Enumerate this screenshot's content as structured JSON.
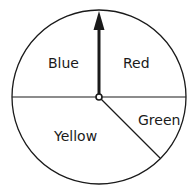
{
  "spinner": {
    "sections": [
      {
        "label": "Blue",
        "start_deg": 90,
        "end_deg": 180,
        "fraction": 0.25
      },
      {
        "label": "Red",
        "start_deg": 0,
        "end_deg": 90,
        "fraction": 0.25
      },
      {
        "label": "Green",
        "start_deg": -45,
        "end_deg": 0,
        "fraction": 0.125
      },
      {
        "label": "Yellow",
        "start_deg": 180,
        "end_deg": 315,
        "fraction": 0.375
      }
    ],
    "pointer_direction": "up",
    "stroke_color": "#1a1a1a",
    "fill_color": "#ffffff"
  }
}
